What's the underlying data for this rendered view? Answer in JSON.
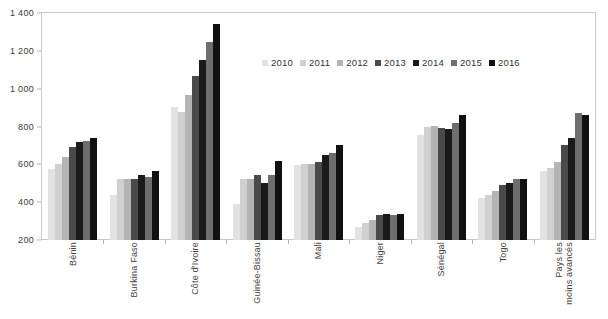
{
  "chart_data": {
    "type": "bar",
    "title": "",
    "subtitle": "",
    "xlabel": "",
    "ylabel": "",
    "ylim": [
      200,
      1400
    ],
    "ytick_step": 200,
    "ytick_labels": [
      "200",
      "400",
      "600",
      "800",
      "1 000",
      "1 200",
      "1 400"
    ],
    "ytick_values": [
      200,
      400,
      600,
      800,
      1000,
      1200,
      1400
    ],
    "grid": false,
    "legend_position": "top-center",
    "categories": [
      "Bénin",
      "Burkina Faso",
      "Côte d'Ivoire",
      "Guinée-Bissau",
      "Mali",
      "Niger",
      "Sénégal",
      "Togo",
      "Pays les\nmoins avancés"
    ],
    "series": [
      {
        "name": "2010",
        "color": "#e2e2e2",
        "values": [
          575,
          440,
          905,
          390,
          595,
          270,
          755,
          420,
          565
        ]
      },
      {
        "name": "2011",
        "color": "#d0d0d0",
        "values": [
          600,
          520,
          875,
          520,
          600,
          290,
          800,
          440,
          580
        ]
      },
      {
        "name": "2012",
        "color": "#b4b4b4",
        "values": [
          640,
          525,
          965,
          520,
          600,
          305,
          805,
          460,
          615
        ]
      },
      {
        "name": "2013",
        "color": "#4a4a4a",
        "values": [
          690,
          525,
          1065,
          545,
          615,
          330,
          790,
          490,
          700
        ]
      },
      {
        "name": "2014",
        "color": "#1a1a1a",
        "values": [
          720,
          545,
          1150,
          500,
          650,
          335,
          785,
          500,
          740
        ]
      },
      {
        "name": "2015",
        "color": "#6e6e6e",
        "values": [
          725,
          535,
          1248,
          545,
          660,
          330,
          820,
          520,
          870
        ]
      },
      {
        "name": "2016",
        "color": "#111111",
        "values": [
          740,
          565,
          1340,
          620,
          700,
          340,
          860,
          525,
          860
        ]
      }
    ]
  }
}
